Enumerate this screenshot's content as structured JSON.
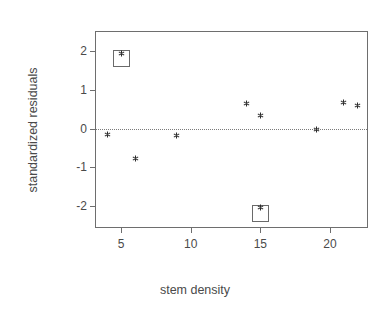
{
  "figure": {
    "background_color": "#ffffff",
    "frame_color": "#6e6e6e",
    "marker_color": "#2b2b2b",
    "zero_line_color": "#7a7a7a"
  },
  "chart_data": {
    "type": "scatter",
    "title": "",
    "xlabel": "stem density",
    "ylabel": "standardized residuals",
    "xlim": [
      3.2,
      22.8
    ],
    "ylim": [
      -2.6,
      2.5
    ],
    "xticks": [
      5,
      10,
      15,
      20
    ],
    "xticklabels": [
      "5",
      "10",
      "15",
      "20"
    ],
    "yticks": [
      2,
      1,
      0,
      -1,
      -2
    ],
    "yticklabels": [
      "2",
      "1",
      "0",
      "-1",
      "-2"
    ],
    "grid": false,
    "legend": null,
    "reference_lines": [
      {
        "name": "zero-line",
        "axis": "y",
        "value": 0,
        "style": "dotted"
      }
    ],
    "marker_symbol": "*",
    "x": [
      4.0,
      5.0,
      6.0,
      9.0,
      14.0,
      15.0,
      15.0,
      19.0,
      21.0,
      22.0
    ],
    "y": [
      -0.15,
      1.95,
      -0.78,
      -0.17,
      0.65,
      0.33,
      -2.05,
      -0.03,
      0.68,
      0.6
    ],
    "points": [
      {
        "x": 4.0,
        "y": -0.15,
        "highlighted": false
      },
      {
        "x": 5.0,
        "y": 1.95,
        "highlighted": true
      },
      {
        "x": 6.0,
        "y": -0.78,
        "highlighted": false
      },
      {
        "x": 9.0,
        "y": -0.17,
        "highlighted": false
      },
      {
        "x": 14.0,
        "y": 0.65,
        "highlighted": false
      },
      {
        "x": 15.0,
        "y": 0.33,
        "highlighted": false
      },
      {
        "x": 15.0,
        "y": -2.05,
        "highlighted": true
      },
      {
        "x": 19.0,
        "y": -0.03,
        "highlighted": false
      },
      {
        "x": 21.0,
        "y": 0.68,
        "highlighted": false
      },
      {
        "x": 22.0,
        "y": 0.6,
        "highlighted": false
      }
    ],
    "annotations": [
      {
        "name": "outlier-box-high",
        "x": 5.0,
        "y": 1.95,
        "shape": "square"
      },
      {
        "name": "outlier-box-low",
        "x": 15.0,
        "y": -2.05,
        "shape": "square"
      }
    ]
  }
}
